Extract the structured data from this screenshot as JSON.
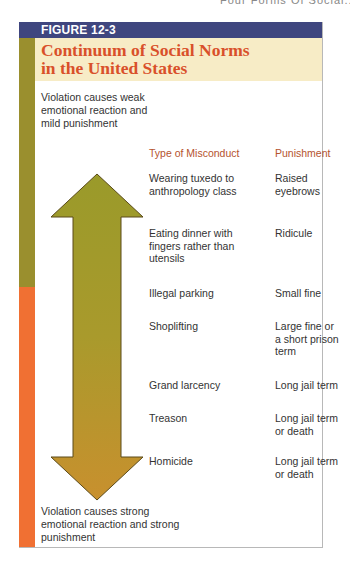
{
  "page": {
    "running_header": "Four Forms Of Social..."
  },
  "figure": {
    "label": "FIGURE 12-3",
    "title_line1": "Continuum of Social Norms",
    "title_line2": "in the United States",
    "top_caption": "Violation causes weak emotional reaction and mild punishment",
    "bottom_caption": "Violation causes strong emotional reaction and strong punishment",
    "columns": {
      "misconduct": "Type of Misconduct",
      "punishment": "Punishment"
    },
    "rows": [
      {
        "misconduct": "Wearing tuxedo to anthropology class",
        "punishment": "Raised eyebrows"
      },
      {
        "misconduct": "Eating dinner with fingers rather than utensils",
        "punishment": "Ridicule"
      },
      {
        "misconduct": "Illegal parking",
        "punishment": "Small fine"
      },
      {
        "misconduct": "Shoplifting",
        "punishment": "Large fine or a short prison term"
      },
      {
        "misconduct": "Grand larcency",
        "punishment": "Long jail term"
      },
      {
        "misconduct": "Treason",
        "punishment": "Long jail term or death"
      },
      {
        "misconduct": "Homicide",
        "punishment": "Long jail term or death"
      }
    ],
    "arrow": {
      "type": "double-headed-vertical",
      "color_top": "#9a9a2a",
      "color_bottom": "#c8902e"
    },
    "colors": {
      "label_bar": "#3f467f",
      "title_band": "#f7ecc6",
      "title_text": "#d9502a",
      "side_bar_top": "#9a8f2e",
      "side_bar_bottom": "#f07033",
      "column_heading": "#b5532e"
    }
  }
}
